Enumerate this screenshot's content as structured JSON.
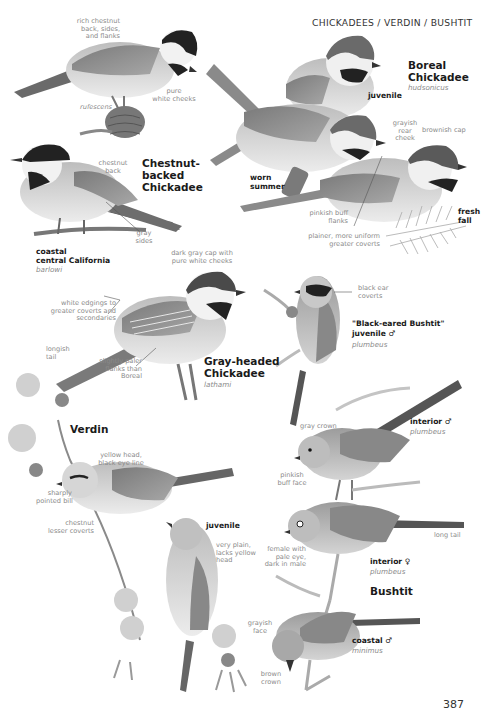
{
  "header": {
    "section_title": "CHICKADEES / VERDIN / BUSHTIT",
    "page_number": "387"
  },
  "species": {
    "chestnut_backed": {
      "name": "Chestnut-\nbacked\nChickadee",
      "notes": {
        "back": "rich chestnut\nback, sides,\nand flanks",
        "cheeks": "pure\nwhite cheeks",
        "rufescens": "rufescens",
        "chestnut_back": "chestnut\nback",
        "gray_sides": "gray\nsides"
      },
      "variant": {
        "label": "coastal\ncentral California",
        "scientific": "barlowi"
      }
    },
    "boreal": {
      "name": "Boreal\nChickadee",
      "scientific": "hudsonicus",
      "labels": {
        "juvenile": "juvenile",
        "worn_summer": "worn\nsummer",
        "fresh_fall": "fresh\nfall"
      },
      "notes": {
        "rear_cheek": "grayish\nrear\ncheek",
        "cap": "brownish cap",
        "flanks": "pinkish buff\nflanks",
        "coverts": "plainer, more uniform\ngreater coverts"
      }
    },
    "gray_headed": {
      "name": "Gray-headed\nChickadee",
      "scientific": "lathami",
      "notes": {
        "cap": "dark gray cap with\npure white cheeks",
        "edgings": "white edgings to\ngreater coverts and\nsecondaries",
        "tail": "longish\ntail",
        "flanks": "slightly paler\nflanks than\nBoreal"
      }
    },
    "verdin": {
      "name": "Verdin",
      "labels": {
        "juvenile": "juvenile"
      },
      "notes": {
        "head": "yellow head,\nblack eye line",
        "bill": "sharply\npointed bill",
        "coverts": "chestnut\nlesser coverts",
        "juvenile": "very plain,\nlacks yellow\nhead"
      }
    },
    "bushtit": {
      "name": "Bushtit",
      "black_eared": {
        "name": "\"Black-eared Bushtit\"",
        "label": "juvenile ♂",
        "scientific": "plumbeus",
        "note": "black ear\ncoverts"
      },
      "interior_male": {
        "label": "interior ♂",
        "scientific": "plumbeus"
      },
      "interior_female": {
        "label": "interior ♀",
        "scientific": "plumbeus"
      },
      "coastal_male": {
        "label": "coastal ♂",
        "scientific": "minimus"
      },
      "notes": {
        "crown": "gray crown",
        "face": "pinkish\nbuff face",
        "tail": "long tail",
        "eye": "female with\npale eye,\ndark in male",
        "grayish_face": "grayish\nface",
        "brown_crown": "brown\ncrown"
      }
    }
  },
  "colors": {
    "ink": "#1a1a1a",
    "note": "#8a8a8a",
    "bird_body": "#c9c9c9",
    "bird_dark": "#2a2a2a",
    "wing": "#8f8f8f"
  }
}
